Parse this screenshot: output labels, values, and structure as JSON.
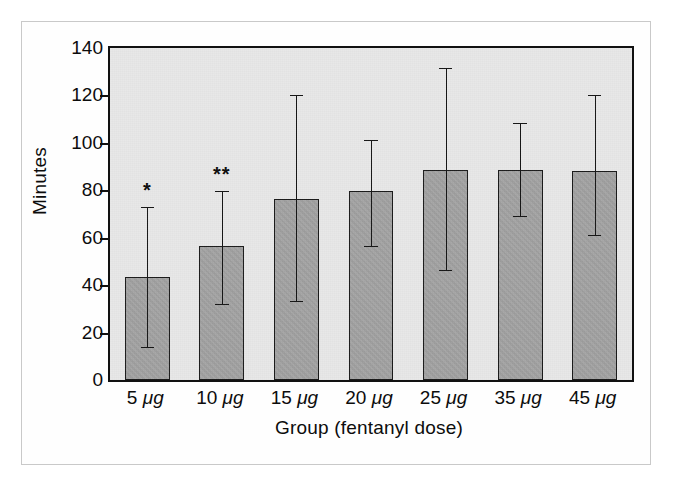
{
  "chart_data": {
    "type": "bar",
    "title": "",
    "xlabel": "Group (fentanyl dose)",
    "ylabel": "Minutes",
    "categories": [
      "5 μg",
      "10 μg",
      "15 μg",
      "20 μg",
      "25 μg",
      "35 μg",
      "45 μg"
    ],
    "values": [
      43.5,
      56.5,
      76.5,
      79.5,
      88.5,
      88.5,
      88.0
    ],
    "error_high": [
      73.0,
      79.5,
      120.0,
      101.0,
      131.5,
      108.5,
      120.0
    ],
    "error_low": [
      14.0,
      32.0,
      33.5,
      56.5,
      46.5,
      69.0,
      61.0
    ],
    "annotations": [
      "*",
      "**",
      "",
      "",
      "",
      "",
      ""
    ],
    "ylim": [
      0,
      140
    ],
    "yticks": [
      0,
      20,
      40,
      60,
      80,
      100,
      120,
      140
    ],
    "ytick_labels": [
      "0",
      "20",
      "40",
      "60",
      "80",
      "100",
      "120",
      "140"
    ],
    "grid": false,
    "legend": "none",
    "bar_color": "#a3a3a3",
    "bar_edge_color": "#1a1a1a",
    "plot_background": "#e8e8e8",
    "axis_color": "#111111",
    "error_bar_color": "#151515"
  }
}
